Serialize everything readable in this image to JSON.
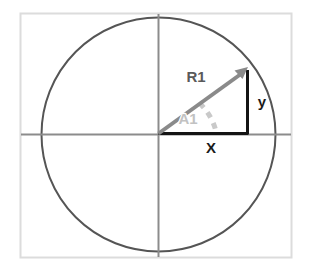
{
  "figure": {
    "name": "unit-circle-right-triangle-diagram",
    "background_color": "#ffffff",
    "frame": {
      "color": "#d9d9d9",
      "x": 20,
      "y": 13,
      "width": 272,
      "height": 245
    },
    "circle": {
      "name": "circle-outline",
      "center_x": 158.5,
      "center_y": 134.5,
      "radius": 117,
      "color": "#555555",
      "stroke_width": 2,
      "fill": "none"
    },
    "axes": {
      "color": "#8c8c8c",
      "stroke_width": 2,
      "horizontal": {
        "x1": 21,
        "y1": 134.5,
        "x2": 291,
        "y2": 134.5
      },
      "vertical": {
        "x1": 158.5,
        "y1": 14,
        "x2": 158.5,
        "y2": 257
      }
    },
    "radius_vector": {
      "label": "R1",
      "color": "#8a8a8a",
      "stroke_width": 4,
      "from_x": 158.5,
      "from_y": 133.5,
      "to_x": 247,
      "to_y": 70,
      "arrowhead": true,
      "label_x": 196,
      "label_y": 82
    },
    "opposite_side": {
      "label": "y",
      "color": "#141414",
      "stroke_width": 3,
      "from_x": 247.5,
      "from_y": 70,
      "to_x": 247.5,
      "to_y": 133.5,
      "label_x": 262,
      "label_y": 106
    },
    "adjacent_side": {
      "label": "X",
      "color": "#141414",
      "stroke_width": 3,
      "from_x": 158.5,
      "from_y": 133.5,
      "to_x": 248,
      "to_y": 133.5,
      "label_x": 210,
      "label_y": 152
    },
    "angle_arc": {
      "label": "A1",
      "color": "#c9c9c9",
      "stroke_width": 5,
      "dash_pattern": "6 6",
      "arc_radius": 58,
      "start_x": 199.6,
      "start_y": 103.3,
      "end_x": 216.5,
      "end_y": 133.5,
      "label_x": 186,
      "label_y": 122
    }
  }
}
